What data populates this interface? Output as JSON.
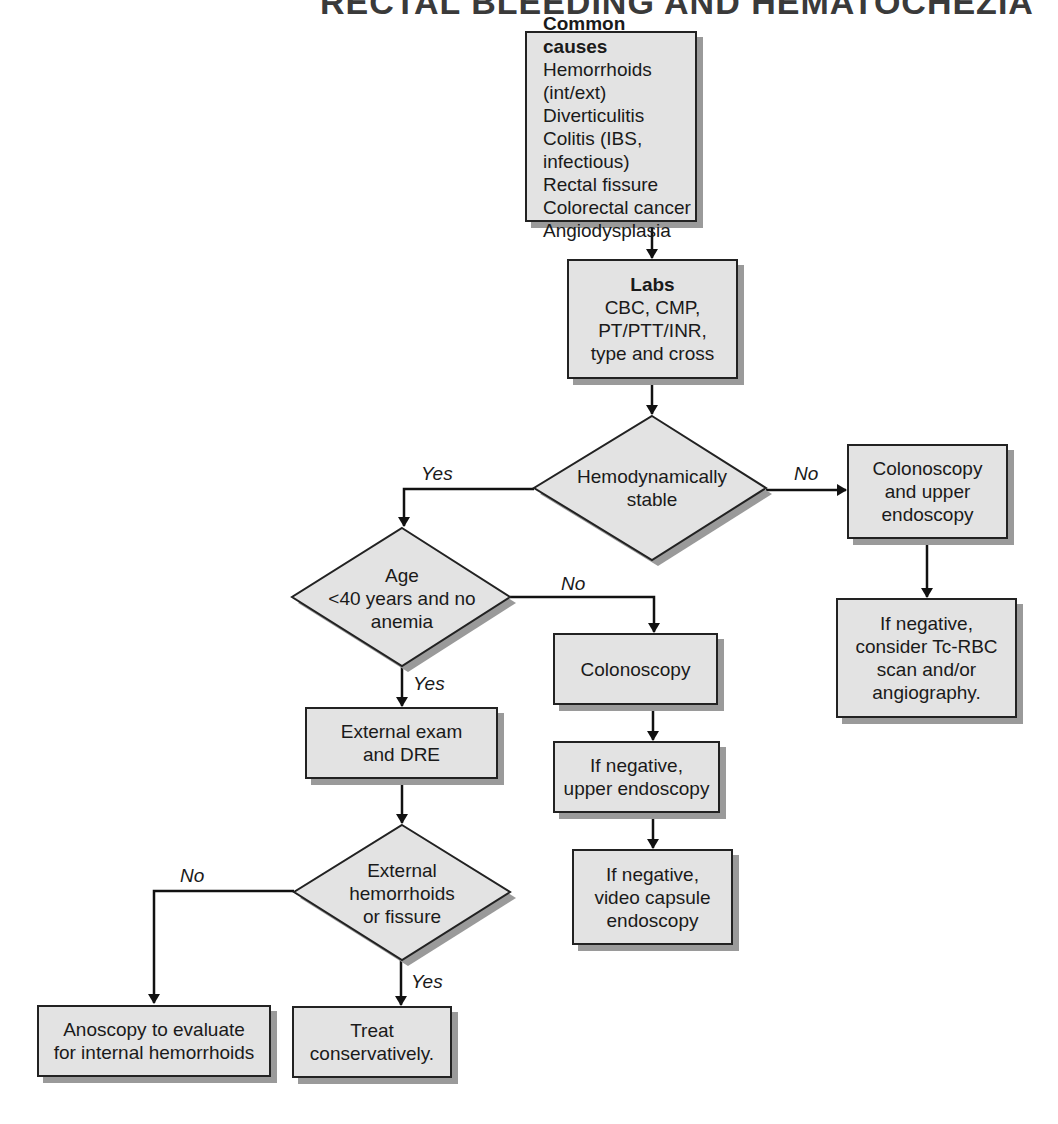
{
  "title": "RECTAL BLEEDING AND HEMATOCHEZIA",
  "nodes": {
    "common_causes": {
      "heading": "Common causes",
      "items": [
        "Hemorrhoids (int/ext)",
        "Diverticulitis",
        "Colitis (IBS, infectious)",
        "Rectal fissure",
        "Colorectal cancer",
        "Angiodysplasia"
      ]
    },
    "labs": {
      "heading": "Labs",
      "lines": [
        "CBC, CMP,",
        "PT/PTT/INR,",
        "type and cross"
      ]
    },
    "hemodynamically_stable": {
      "lines": [
        "Hemodynamically",
        "stable"
      ]
    },
    "colonoscopy_upper": {
      "lines": [
        "Colonoscopy",
        "and upper",
        "endoscopy"
      ]
    },
    "tc_rbc": {
      "lines": [
        "If negative,",
        "consider Tc-RBC",
        "scan and/or",
        "angiography."
      ]
    },
    "age_decision": {
      "lines": [
        "Age",
        "<40 years and no",
        "anemia"
      ]
    },
    "colonoscopy": {
      "lines": [
        "Colonoscopy"
      ]
    },
    "upper_endoscopy": {
      "lines": [
        "If negative,",
        "upper endoscopy"
      ]
    },
    "video_capsule": {
      "lines": [
        "If negative,",
        "video capsule",
        "endoscopy"
      ]
    },
    "external_exam": {
      "lines": [
        "External exam",
        "and DRE"
      ]
    },
    "ext_hemorrhoids_decision": {
      "lines": [
        "External",
        "hemorrhoids",
        "or fissure"
      ]
    },
    "anoscopy": {
      "lines": [
        "Anoscopy to evaluate",
        "for internal hemorrhoids"
      ]
    },
    "treat": {
      "lines": [
        "Treat",
        "conservatively."
      ]
    }
  },
  "edge_labels": {
    "stable_yes": "Yes",
    "stable_no": "No",
    "age_no": "No",
    "age_yes": "Yes",
    "ext_no": "No",
    "ext_yes": "Yes"
  },
  "colors": {
    "box_fill": "#e3e3e3",
    "border": "#222222",
    "shadow": "#9a9a9a",
    "background": "#ffffff"
  }
}
